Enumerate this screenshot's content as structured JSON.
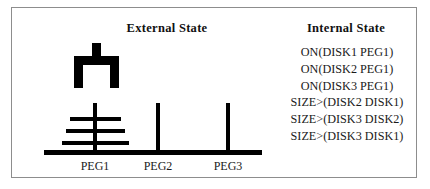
{
  "figure": {
    "kind": "towers-of-hanoi-state-figure",
    "border_color": "#8d8d8d",
    "ink_color": "#000000",
    "background": "#ffffff"
  },
  "panels": {
    "external": {
      "title": "External State",
      "pegs": [
        {
          "id": "peg1",
          "label": "PEG1",
          "disks": [
            "DISK1",
            "DISK2",
            "DISK3"
          ]
        },
        {
          "id": "peg2",
          "label": "PEG2",
          "disks": []
        },
        {
          "id": "peg3",
          "label": "PEG3",
          "disks": []
        }
      ],
      "gripper": {
        "name": "gripper",
        "holding": "",
        "over_peg": "PEG1"
      },
      "disk_sizes": {
        "DISK1": "small",
        "DISK2": "medium",
        "DISK3": "large"
      }
    },
    "internal": {
      "title": "Internal State",
      "predicates": [
        "ON(DISK1 PEG1)",
        "ON(DISK2 PEG1)",
        "ON(DISK3 PEG1)",
        "SIZE>(DISK2 DISK1)",
        "SIZE>(DISK3 DISK2)",
        "SIZE>(DISK3 DISK1)"
      ]
    }
  }
}
